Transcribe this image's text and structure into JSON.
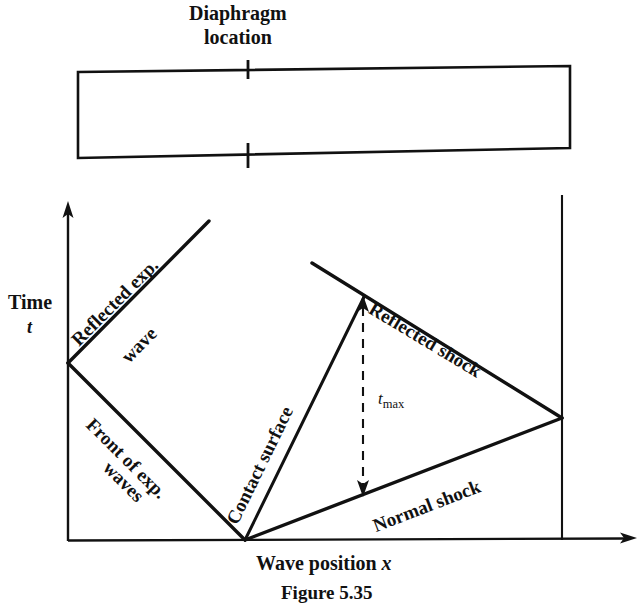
{
  "figure": {
    "caption": "Figure 5.35",
    "header": {
      "line1": "Diaphragm",
      "line2": "location"
    },
    "axes": {
      "y_name": "Time",
      "y_symbol": "t",
      "x_label_text": "Wave position ",
      "x_label_symbol": "x"
    },
    "annotations": {
      "tmax_symbol": "t",
      "tmax_subscript": "max"
    },
    "curves": [
      {
        "id": "reflected-exp-wave",
        "label_line1": "Reflected exp.",
        "label_line2": "wave"
      },
      {
        "id": "front-of-exp-waves",
        "label_line1": "Front of exp.",
        "label_line2": "waves"
      },
      {
        "id": "contact-surface",
        "label": "Contact surface"
      },
      {
        "id": "reflected-shock",
        "label": "Reflected shock"
      },
      {
        "id": "normal-shock",
        "label": "Normal shock"
      }
    ],
    "colors": {
      "ink": "#111111",
      "paper": "#ffffff"
    }
  }
}
